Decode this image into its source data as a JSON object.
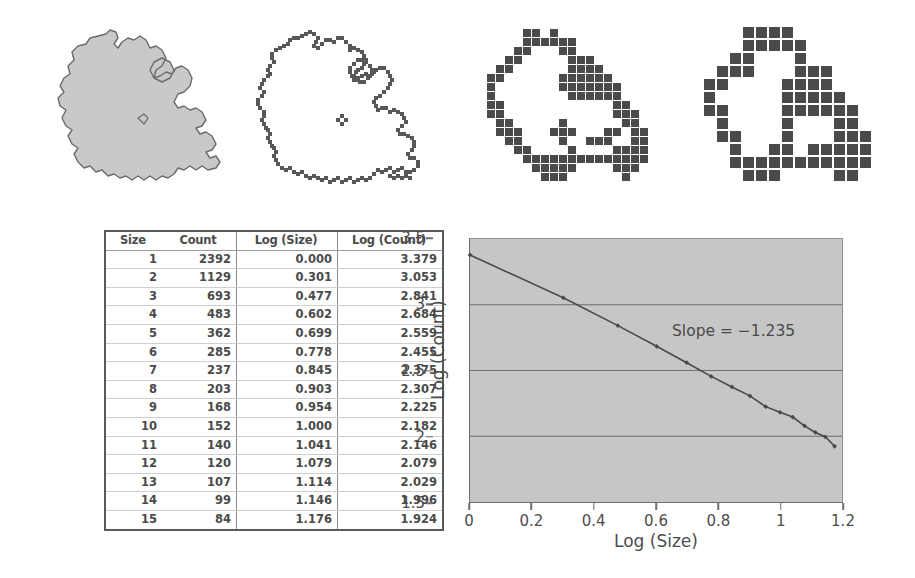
{
  "figure": {
    "panels": [
      {
        "name": "solid-island",
        "label": "solid island outline",
        "box_size": 0,
        "fill": "#c9c9c9",
        "stroke": "#6b6b6b"
      },
      {
        "name": "box-count-size-1",
        "label": "box counting, smallest boxes",
        "box_size": 4,
        "fill": "#585858",
        "stroke": "#ffffff"
      },
      {
        "name": "box-count-size-medium",
        "label": "box counting, medium boxes",
        "box_size": 9,
        "fill": "#4a4a4a",
        "stroke": "#ffffff"
      },
      {
        "name": "box-count-size-large",
        "label": "box counting, largest boxes",
        "box_size": 13,
        "fill": "#4a4a4a",
        "stroke": "#ffffff"
      }
    ]
  },
  "table": {
    "headers": [
      "Size",
      "Count",
      "Log (Size)",
      "Log (Count)"
    ],
    "rows": [
      [
        "1",
        "2392",
        "0.000",
        "3.379"
      ],
      [
        "2",
        "1129",
        "0.301",
        "3.053"
      ],
      [
        "3",
        "693",
        "0.477",
        "2.841"
      ],
      [
        "4",
        "483",
        "0.602",
        "2.684"
      ],
      [
        "5",
        "362",
        "0.699",
        "2.559"
      ],
      [
        "6",
        "285",
        "0.778",
        "2.455"
      ],
      [
        "7",
        "237",
        "0.845",
        "2.375"
      ],
      [
        "8",
        "203",
        "0.903",
        "2.307"
      ],
      [
        "9",
        "168",
        "0.954",
        "2.225"
      ],
      [
        "10",
        "152",
        "1.000",
        "2.182"
      ],
      [
        "11",
        "140",
        "1.041",
        "2.146"
      ],
      [
        "12",
        "120",
        "1.079",
        "2.079"
      ],
      [
        "13",
        "107",
        "1.114",
        "2.029"
      ],
      [
        "14",
        "99",
        "1.146",
        "1.996"
      ],
      [
        "15",
        "84",
        "1.176",
        "1.924"
      ]
    ]
  },
  "chart_data": {
    "type": "scatter",
    "title": "",
    "xlabel": "Log (Size)",
    "ylabel": "Log (Count)",
    "xlim": [
      0,
      1.2
    ],
    "ylim": [
      1.5,
      3.5
    ],
    "xticks": [
      "0",
      "0.2",
      "0.4",
      "0.6",
      "0.8",
      "1",
      "1.2"
    ],
    "xtick_values": [
      0,
      0.2,
      0.4,
      0.6,
      0.8,
      1,
      1.2
    ],
    "yticks": [
      "1.5",
      "2",
      "2.5",
      "3",
      "3.5"
    ],
    "ytick_values": [
      1.5,
      2,
      2.5,
      3,
      3.5
    ],
    "grid": "horizontal",
    "plot_background": "#c6c6c6",
    "gridline_color": "#6d6d6d",
    "series": [
      {
        "name": "Log (Count) vs Log (Size)",
        "marker": "diamond",
        "color": "#4a4a4a",
        "line": true,
        "x": [
          0.0,
          0.301,
          0.477,
          0.602,
          0.699,
          0.778,
          0.845,
          0.903,
          0.954,
          1.0,
          1.041,
          1.079,
          1.114,
          1.146,
          1.176
        ],
        "y": [
          3.379,
          3.053,
          2.841,
          2.684,
          2.559,
          2.455,
          2.375,
          2.307,
          2.225,
          2.182,
          2.146,
          2.079,
          2.029,
          1.996,
          1.924
        ]
      }
    ],
    "annotations": [
      {
        "name": "slope-label",
        "text": "Slope = −1.235",
        "x": 0.66,
        "y": 2.77
      }
    ],
    "slope": -1.235,
    "legend": "none"
  },
  "annotations": {
    "slope_label": "Slope = −1.235"
  }
}
